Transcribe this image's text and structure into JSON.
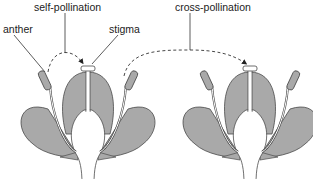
{
  "labels": {
    "self_pollination": "self-pollination",
    "anther": "anther",
    "stigma": "stigma",
    "cross_pollination": "cross-pollination"
  },
  "colors": {
    "petal": "#a9a9a9",
    "outline": "#4a4a4a",
    "stalk": "#ffffff",
    "text": "#222222"
  },
  "flowers": [
    {
      "name": "left-flower",
      "center_x": 88
    },
    {
      "name": "right-flower",
      "center_x": 250
    }
  ]
}
